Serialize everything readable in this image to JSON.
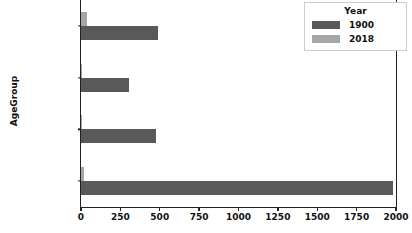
{
  "chart_data": {
    "type": "bar",
    "orientation": "horizontal",
    "title": "",
    "xlabel": "",
    "ylabel": "AgeGroup",
    "categories": [
      "01-04 Years",
      "05-09 Years",
      "10-14 Years",
      "15-19 Years"
    ],
    "xlim": [
      0,
      2000
    ],
    "xticks": [
      0,
      250,
      500,
      750,
      1000,
      1250,
      1500,
      1750,
      2000
    ],
    "xtick_labels": [
      "0",
      "250",
      "500",
      "750",
      "1000",
      "1250",
      "1500",
      "1750",
      "2000"
    ],
    "grid": false,
    "legend": {
      "title": "Year",
      "position": "upper right",
      "entries": [
        {
          "label": "1900",
          "color": "#595959"
        },
        {
          "label": "2018",
          "color": "#a6a6a6"
        }
      ]
    },
    "series": [
      {
        "name": "1900",
        "color": "#595959",
        "values": [
          1983,
          476,
          305,
          489
        ]
      },
      {
        "name": "2018",
        "color": "#a6a6a6",
        "values": [
          21,
          6,
          5,
          40
        ]
      }
    ]
  },
  "axes": {
    "ylabel": "AgeGroup"
  }
}
